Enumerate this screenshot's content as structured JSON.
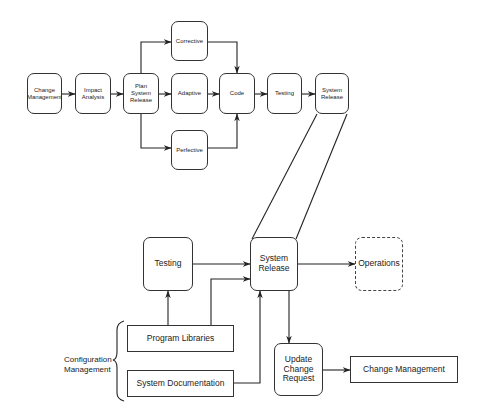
{
  "top_flow": {
    "change_management": "Change\nManagement",
    "impact_analysis": "Impact\nAnalysis",
    "plan_release": "Plan\nSystem\nRelease",
    "corrective": "Corrective",
    "adaptive": "Adaptive",
    "perfective": "Perfective",
    "code": "Code",
    "testing": "Testing",
    "system_release": "System\nRelease"
  },
  "bottom_flow": {
    "testing": "Testing",
    "system_release": "System\nRelease",
    "operations": "Operations",
    "program_libraries": "Program Libraries",
    "system_documentation": "System Documentation",
    "update_change_request": "Update\nChange\nRequest",
    "change_management": "Change Management",
    "configuration_management": "Configuration\nManagement"
  }
}
